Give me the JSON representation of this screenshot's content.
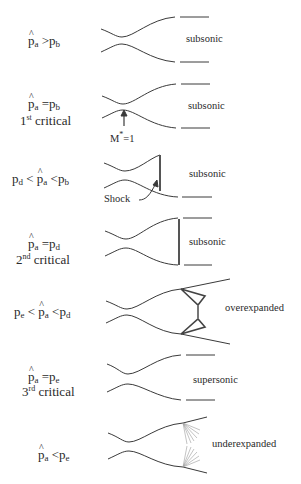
{
  "figure": {
    "rows": [
      {
        "condition": {
          "lhs": "p̂a",
          "op1": ">",
          "rhs": "pb"
        },
        "label": "",
        "regime": "subsonic"
      },
      {
        "condition": {
          "lhs": "p̂a",
          "op1": "=",
          "rhs": "pb"
        },
        "label_num": "1",
        "label_sup": "st",
        "label_text": "critical",
        "regime": "subsonic",
        "annotation": {
          "text": "M",
          "sup": "*",
          "tail": "=1"
        }
      },
      {
        "condition": {
          "left": "pd",
          "op1": "<",
          "mid": "p̂a",
          "op2": "<",
          "right": "pb"
        },
        "regime": "subsonic",
        "annotation": {
          "text": "Shock"
        }
      },
      {
        "condition": {
          "lhs": "p̂a",
          "op1": "=",
          "rhs": "pd"
        },
        "label_num": "2",
        "label_sup": "nd",
        "label_text": "critical",
        "regime": "subsonic"
      },
      {
        "condition": {
          "left": "pe",
          "op1": "<",
          "mid": "p̂a",
          "op2": "<",
          "right": "pd"
        },
        "regime": "overexpanded"
      },
      {
        "condition": {
          "lhs": "p̂a",
          "op1": "=",
          "rhs": "pe"
        },
        "label_num": "3",
        "label_sup": "rd",
        "label_text": "critical",
        "regime": "supersonic"
      },
      {
        "condition": {
          "lhs": "p̂a",
          "op1": "<",
          "rhs": "pe"
        },
        "regime": "underexpanded"
      }
    ]
  },
  "symbols": {
    "p": "p",
    "a": "a",
    "b": "b",
    "d": "d",
    "e": "e",
    "gt": ">",
    "lt": "<",
    "eq": "="
  },
  "colors": {
    "line": "#3a3a3a",
    "text": "#2a2a2a",
    "fan": "#9a9a9a"
  }
}
